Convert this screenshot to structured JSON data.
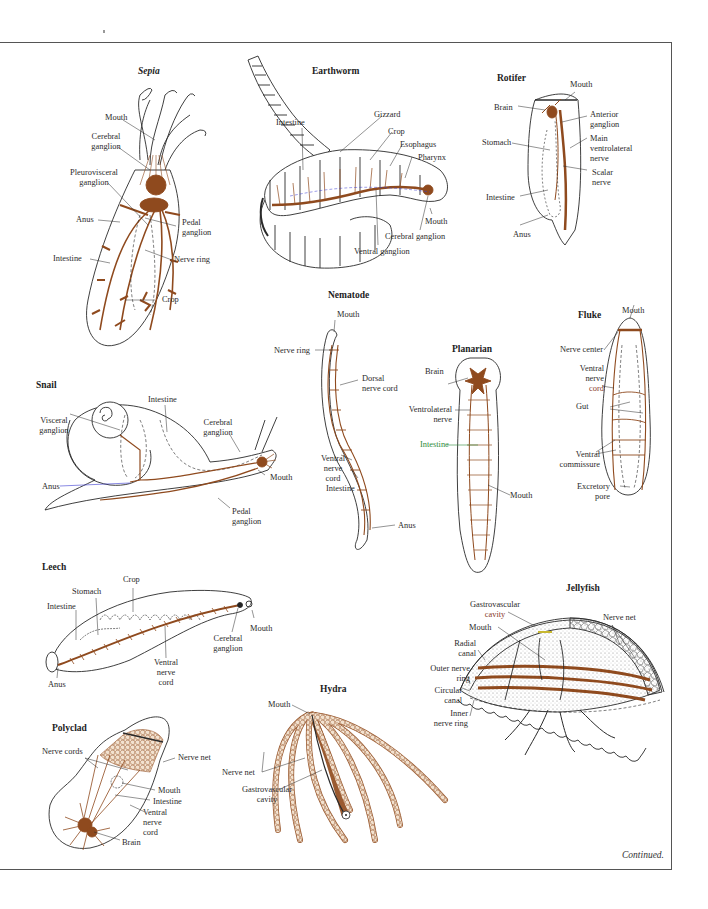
{
  "page": {
    "footer_note": "Continued.",
    "colors": {
      "nerve": "#8f4a1e",
      "outline": "#2a2a2a",
      "accent_green": "#2e8b3a",
      "accent_blue": "#3a3ad0"
    }
  },
  "figures": {
    "sepia": {
      "title": "Sepia",
      "labels": [
        "Mouth",
        "Cerebral",
        "ganglion",
        "Pleurovisceral",
        "ganglion",
        "Anus",
        "Pedal",
        "ganglion",
        "Intestine",
        "Nerve ring",
        "Crop"
      ]
    },
    "earthworm": {
      "title": "Earthworm",
      "labels": [
        "Intestine",
        "Gizzard",
        "Crop",
        "Esophagus",
        "Pharynx",
        "Mouth",
        "Cerebral ganglion",
        "Ventral ganglion"
      ]
    },
    "rotifer": {
      "title": "Rotifer",
      "labels": [
        "Mouth",
        "Brain",
        "Anterior",
        "ganglion",
        "Stomach",
        "Main",
        "ventrolateral",
        "nerve",
        "Scalar",
        "nerve",
        "Intestine",
        "Anus"
      ]
    },
    "snail": {
      "title": "Snail",
      "labels": [
        "Intestine",
        "Visceral",
        "ganglion",
        "Cerebral",
        "ganglion",
        "Mouth",
        "Anus",
        "Pedal",
        "ganglion"
      ]
    },
    "nematode": {
      "title": "Nematode",
      "labels": [
        "Mouth",
        "Nerve ring",
        "Dorsal",
        "nerve cord",
        "Ventral",
        "nerve",
        "cord",
        "Intestine",
        "Anus"
      ]
    },
    "planarian": {
      "title": "Planarian",
      "labels": [
        "Brain",
        "Ventrolateral",
        "nerve",
        "Intestine",
        "Mouth"
      ]
    },
    "fluke": {
      "title": "Fluke",
      "labels": [
        "Mouth",
        "Nerve center",
        "Ventral",
        "nerve",
        "cord",
        "Gut",
        "Ventral",
        "commissure",
        "Excretory",
        "pore"
      ]
    },
    "leech": {
      "title": "Leech",
      "labels": [
        "Crop",
        "Stomach",
        "Intestine",
        "Mouth",
        "Cerebral",
        "ganglion",
        "Ventral",
        "nerve",
        "cord",
        "Anus"
      ]
    },
    "jellyfish": {
      "title": "Jellyfish",
      "labels": [
        "Gastrovascular",
        "cavity",
        "Nerve net",
        "Mouth",
        "Radial",
        "canal",
        "Outer nerve",
        "ring",
        "Circular",
        "canal",
        "Inner",
        "nerve ring"
      ]
    },
    "polyclad": {
      "title": "Polyclad",
      "labels": [
        "Nerve cords",
        "Nerve net",
        "Mouth",
        "Intestine",
        "Ventral",
        "nerve",
        "cord",
        "Brain"
      ]
    },
    "hydra": {
      "title": "Hydra",
      "labels": [
        "Mouth",
        "Nerve net",
        "Gastrovascular",
        "cavity"
      ]
    }
  }
}
